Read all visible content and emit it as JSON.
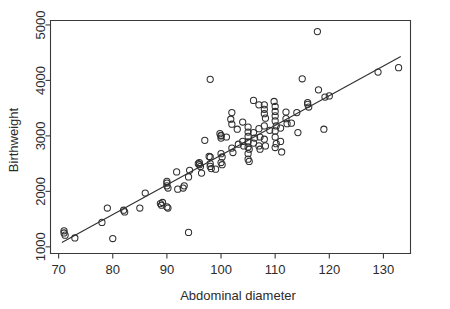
{
  "chart_data": {
    "type": "scatter",
    "title": "",
    "xlabel": "Abdominal diameter",
    "ylabel": "Birthweight",
    "xlim": [
      68.5,
      135.0
    ],
    "ylim": [
      880,
      5080
    ],
    "xticks": [
      70,
      80,
      90,
      100,
      110,
      120,
      130
    ],
    "xtick_labels": [
      "70",
      "80",
      "90",
      "100",
      "110",
      "120",
      "130"
    ],
    "yticks": [
      1000,
      2000,
      3000,
      4000,
      5000
    ],
    "ytick_labels": [
      "1000",
      "2000",
      "3000",
      "4000",
      "5000"
    ],
    "grid": false,
    "legend": null,
    "marker": "open-circle",
    "fit_line": {
      "type": "linear-regression",
      "x_start": 70.6,
      "y_start": 1080,
      "x_end": 133.2,
      "y_end": 4430,
      "slope": 53.5,
      "intercept": -2697
    },
    "x": [
      71.0,
      71.0,
      71.2,
      73.0,
      78.0,
      79.0,
      80.0,
      82.0,
      82.2,
      85.0,
      86.0,
      88.8,
      89.0,
      89.2,
      90.0,
      90.0,
      90.2,
      90.0,
      90.0,
      90.2,
      91.8,
      92.0,
      93.0,
      93.2,
      94.0,
      94.0,
      94.2,
      95.8,
      96.0,
      96.0,
      96.2,
      96.4,
      97.0,
      97.8,
      98.0,
      98.0,
      98.0,
      98.2,
      98.0,
      99.0,
      99.8,
      100.0,
      100.0,
      100.0,
      100.2,
      100.0,
      100.2,
      100.0,
      101.0,
      101.8,
      102.0,
      102.0,
      102.2,
      102.0,
      103.0,
      103.2,
      104.0,
      104.0,
      104.2,
      105.0,
      105.0,
      105.0,
      105.0,
      105.0,
      105.2,
      105.0,
      105.0,
      105.2,
      106.0,
      106.0,
      106.2,
      106.0,
      107.0,
      107.0,
      107.2,
      107.0,
      107.2,
      108.0,
      108.0,
      108.0,
      108.2,
      108.0,
      108.0,
      108.2,
      109.0,
      109.8,
      110.0,
      110.0,
      110.0,
      110.0,
      110.2,
      110.0,
      110.0,
      110.2,
      110.0,
      111.0,
      111.0,
      111.2,
      112.0,
      112.0,
      112.2,
      113.0,
      114.0,
      114.2,
      115.0,
      116.0,
      116.0,
      116.2,
      117.8,
      118.0,
      119.0,
      119.2,
      120.0,
      129.0,
      132.8
    ],
    "y": [
      1250,
      1290,
      1210,
      1160,
      1440,
      1700,
      1150,
      1660,
      1630,
      1700,
      1970,
      1780,
      1750,
      1800,
      2150,
      2100,
      2060,
      2180,
      1720,
      1700,
      2350,
      2040,
      2060,
      2100,
      2260,
      1260,
      2380,
      2500,
      2480,
      2520,
      2450,
      2330,
      2920,
      2630,
      2620,
      2500,
      2450,
      2410,
      4020,
      2400,
      3040,
      3010,
      2960,
      2680,
      2620,
      2520,
      2480,
      3000,
      2980,
      3300,
      3210,
      2780,
      2700,
      3420,
      3120,
      2850,
      3250,
      2900,
      2820,
      3160,
      3070,
      2990,
      2890,
      2800,
      2760,
      2680,
      2580,
      2540,
      3640,
      3060,
      2960,
      2870,
      3560,
      3130,
      2980,
      2820,
      2760,
      3560,
      3480,
      3400,
      3320,
      3180,
      2940,
      2820,
      3100,
      3620,
      3530,
      3440,
      3360,
      3270,
      3180,
      3090,
      2980,
      2860,
      2790,
      3140,
      2900,
      2710,
      3430,
      3310,
      3220,
      3230,
      3420,
      3060,
      4030,
      3600,
      3570,
      3520,
      4880,
      3830,
      3120,
      3700,
      3720,
      4150,
      4230
    ]
  }
}
